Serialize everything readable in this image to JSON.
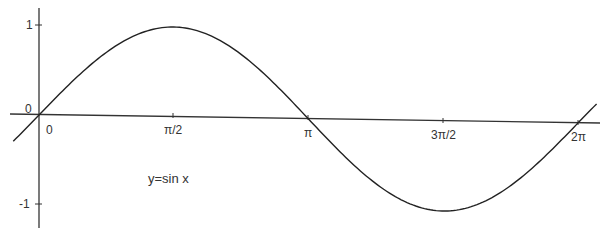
{
  "chart_data": {
    "type": "line",
    "title": "",
    "function_label": "y=sin x",
    "xlabel": "",
    "ylabel": "",
    "x_ticks": [
      {
        "label": "0",
        "value": 0
      },
      {
        "label": "π/2",
        "value": 1.5708
      },
      {
        "label": "π",
        "value": 3.1416
      },
      {
        "label": "3π/2",
        "value": 4.7124
      },
      {
        "label": "2π",
        "value": 6.2832
      }
    ],
    "y_ticks": [
      {
        "label": "1",
        "value": 1
      },
      {
        "label": "0",
        "value": 0
      },
      {
        "label": "-1",
        "value": -1
      }
    ],
    "xlim": [
      -0.3,
      6.5
    ],
    "ylim": [
      -1.2,
      1.2
    ],
    "grid": false,
    "series": [
      {
        "name": "y=sin x",
        "x": [
          -0.3,
          0,
          0.5236,
          1.0472,
          1.5708,
          2.0944,
          2.618,
          3.1416,
          3.6652,
          4.1888,
          4.7124,
          5.236,
          5.7596,
          6.2832,
          6.5
        ],
        "values": [
          -0.2955,
          0,
          0.5,
          0.866,
          1,
          0.866,
          0.5,
          0,
          -0.5,
          -0.866,
          -1,
          -0.866,
          -0.5,
          0,
          0.2151
        ]
      }
    ],
    "line_color": "#222222"
  },
  "labels": {
    "origin": "0",
    "y_one": "1",
    "y_minus_one": "-1",
    "x_zero": "0",
    "x_half_pi": "π/2",
    "x_pi": "π",
    "x_three_half_pi": "3π/2",
    "x_two_pi": "2π",
    "function": "y=sin x"
  }
}
